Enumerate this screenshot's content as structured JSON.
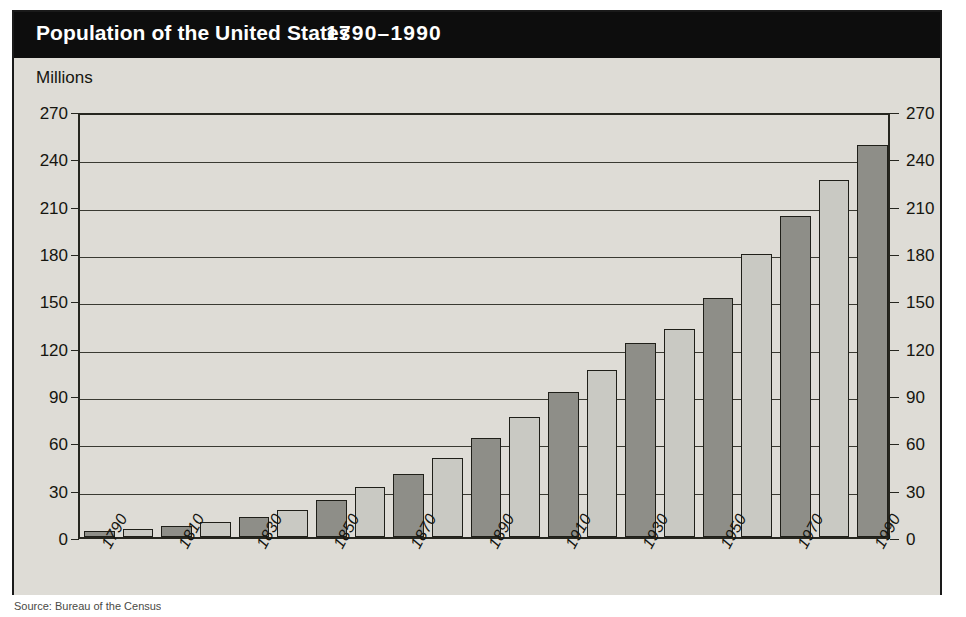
{
  "figure": {
    "title": "Population of the United States",
    "title_range": "1790–1990",
    "units_label": "Millions",
    "footer_note": "Source: Bureau of the Census"
  },
  "chart_data": {
    "type": "bar",
    "title": "Population of the United States 1790–1990",
    "xlabel": "",
    "ylabel": "Millions",
    "ylim": [
      0,
      270
    ],
    "yticks": [
      0,
      30,
      60,
      90,
      120,
      150,
      180,
      210,
      240,
      270
    ],
    "grid": true,
    "legend": "none",
    "dual_axis": true,
    "categories": [
      "1790",
      "1800",
      "1810",
      "1820",
      "1830",
      "1840",
      "1850",
      "1860",
      "1870",
      "1880",
      "1890",
      "1900",
      "1910",
      "1920",
      "1930",
      "1940",
      "1950",
      "1960",
      "1970",
      "1980",
      "1990"
    ],
    "tick_labels_shown": [
      "1790",
      "1810",
      "1830",
      "1850",
      "1870",
      "1890",
      "1910",
      "1930",
      "1950",
      "1970",
      "1990"
    ],
    "values": [
      3.9,
      5.3,
      7.2,
      9.6,
      12.9,
      17.1,
      23.2,
      31.4,
      39.8,
      50.2,
      62.9,
      76.0,
      92.0,
      105.7,
      122.8,
      131.7,
      151.3,
      179.3,
      203.3,
      226.5,
      248.7
    ],
    "bar_colors": [
      "#8e8e88",
      "#c9c9c3"
    ],
    "bar_color_pattern": "alternating dark/light by decade",
    "bar_border_color": "#1f1f19",
    "plot_background": "#dedcd6"
  },
  "palette": {
    "title_band": "#0d0d0d",
    "title_text": "#ffffff",
    "frame": "#1a1a1a",
    "background": "#dedcd6",
    "gridline": "#3a3a32",
    "dark_bar": "#8e8e88",
    "light_bar": "#c9c9c3"
  }
}
